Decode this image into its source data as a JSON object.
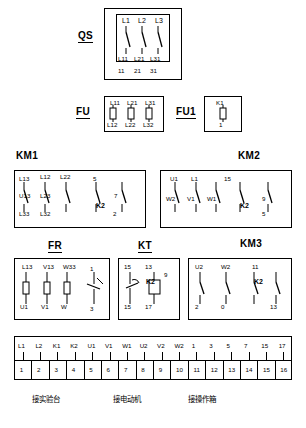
{
  "diagram": {
    "blocks": [
      {
        "name": "QS",
        "label": "QS",
        "top_terminals": [
          "L1",
          "L2",
          "L3"
        ],
        "bottom_terminals": [
          "11",
          "21",
          "31"
        ],
        "inner_terminals": [
          "L11",
          "L21",
          "L31"
        ]
      },
      {
        "name": "FU",
        "label": "FU",
        "top_terminals": [
          "L11",
          "L21",
          "L31"
        ],
        "bottom_terminals": [
          "L12",
          "L22",
          "L32"
        ]
      },
      {
        "name": "FU1",
        "label": "FU1",
        "top_terminals": [
          "K1"
        ],
        "bottom_terminals": [
          "1"
        ]
      },
      {
        "name": "KM1",
        "label": "KM1",
        "top_terminals": [
          "L13",
          "L12",
          "5"
        ],
        "top_terminals_2": [
          "L23",
          "L22",
          "7"
        ],
        "bottom_terminals": [
          "U13",
          "L33",
          "L32"
        ],
        "contact_label": "K2",
        "contact_num": "2"
      },
      {
        "name": "KM2",
        "label": "KM2",
        "top_terminals": [
          "U1",
          "L1",
          "15"
        ],
        "mid_terminals": [
          "W2",
          "V1",
          "9"
        ],
        "contact_label": "K2",
        "contact_num": "5"
      },
      {
        "name": "FR",
        "label": "FR",
        "terminals_top": [
          "L13",
          "V13",
          "W33"
        ],
        "terminals_bottom": [
          "U1",
          "V1",
          "W"
        ],
        "right_terminal": "1",
        "right_bottom": "3"
      },
      {
        "name": "KT",
        "label": "KT",
        "terminals_top": [
          "15",
          "13"
        ],
        "terminals_bottom": [
          "15",
          "17"
        ],
        "contact_label": "K2",
        "contact_num": "9"
      },
      {
        "name": "KM3",
        "label": "KM3",
        "terminals_top": [
          "U2",
          "W2",
          "11"
        ],
        "terminals_bottom": [
          "2",
          "0",
          "13"
        ],
        "contact_label": "K2"
      }
    ],
    "terminal_strip": {
      "row_top": [
        "L1",
        "L2",
        "K1",
        "K2",
        "U1",
        "V1",
        "W1",
        "1",
        "3",
        "5",
        "7",
        "15",
        "17"
      ],
      "row_labels_upper": [
        "L1",
        "L2",
        "K1",
        "K2",
        "U1",
        "V1",
        "W1",
        "U2",
        "V2",
        "W2",
        "1",
        "3",
        "5",
        "7",
        "15",
        "17"
      ],
      "numbers": [
        "1",
        "2",
        "3",
        "4",
        "5",
        "6",
        "7",
        "8",
        "9",
        "10",
        "11",
        "12",
        "13",
        "14",
        "15",
        "16"
      ]
    },
    "captions": [
      {
        "text": "接实验台",
        "position": "left"
      },
      {
        "text": "接电动机",
        "position": "center"
      },
      {
        "text": "接操作箱",
        "position": "right"
      }
    ]
  }
}
